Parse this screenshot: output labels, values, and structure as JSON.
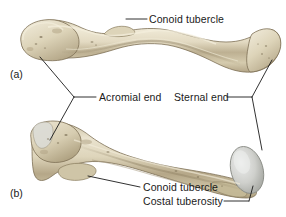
{
  "figure": {
    "background_color": "#ffffff",
    "label_color": "#1a1a1a",
    "leader_color": "#1a1a1a",
    "bone_colors": {
      "base": "#cfc5a8",
      "light": "#e6dfc8",
      "highlight": "#f2ecd9",
      "shadow": "#a89a79",
      "deep_shadow": "#8a7c5e",
      "outline": "#7d7055",
      "cartilage": "#c8c9c4",
      "cartilage_light": "#e2e3df",
      "cartilage_shadow": "#9fa09b"
    }
  },
  "panels": [
    {
      "id": "a",
      "marker": "(a)",
      "view": "superior"
    },
    {
      "id": "b",
      "marker": "(b)",
      "view": "inferior"
    }
  ],
  "labels": [
    {
      "id": "conoid-top",
      "text": "Conoid tubercle",
      "panel": "a"
    },
    {
      "id": "acromial-end",
      "text": "Acromial end",
      "panel": "both"
    },
    {
      "id": "sternal-end",
      "text": "Sternal end",
      "panel": "both"
    },
    {
      "id": "conoid-bottom",
      "text": "Conoid tubercle",
      "panel": "b"
    },
    {
      "id": "costal",
      "text": "Costal tuberosity",
      "panel": "b"
    }
  ]
}
